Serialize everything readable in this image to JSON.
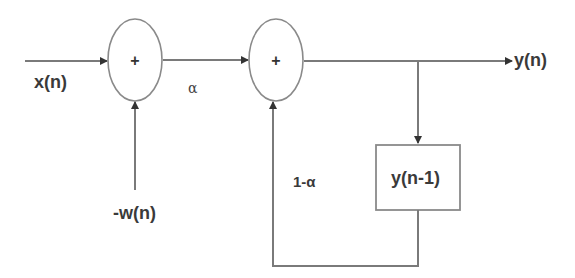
{
  "diagram": {
    "type": "block-diagram",
    "colors": {
      "line": "#7a7a7a",
      "text": "#3a3a3a",
      "background": "#ffffff"
    },
    "nodes": [
      {
        "id": "sum1",
        "shape": "ellipse",
        "symbol": "+"
      },
      {
        "id": "sum2",
        "shape": "ellipse",
        "symbol": "+"
      },
      {
        "id": "delay",
        "shape": "rect",
        "label": "y(n-1)"
      }
    ],
    "labels": {
      "input": "x(n)",
      "negative_input": "-w(n)",
      "gain_forward": "α",
      "gain_feedback": "1-α",
      "output": "y(n)",
      "delay": "y(n-1)",
      "sum1_symbol": "+",
      "sum2_symbol": "+"
    },
    "edges": [
      {
        "from": "x(n)",
        "to": "sum1"
      },
      {
        "from": "-w(n)",
        "to": "sum1"
      },
      {
        "from": "sum1",
        "to": "sum2",
        "label": "α"
      },
      {
        "from": "sum2",
        "to": "y(n)"
      },
      {
        "from": "y(n)",
        "to": "delay"
      },
      {
        "from": "delay",
        "to": "sum2",
        "label": "1-α"
      }
    ]
  }
}
